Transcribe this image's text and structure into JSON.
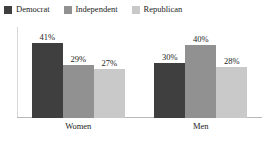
{
  "chart_data": {
    "type": "bar",
    "title": "",
    "subtitle": "",
    "xlabel": "",
    "ylabel": "",
    "categories": [
      "Women",
      "Men"
    ],
    "series": [
      {
        "name": "Democrat",
        "color": "#3f3f3f",
        "values": [
          41,
          30
        ],
        "labels": [
          "41%",
          "30%"
        ]
      },
      {
        "name": "Independent",
        "color": "#919191",
        "values": [
          29,
          40
        ],
        "labels": [
          "29%",
          "40%"
        ]
      },
      {
        "name": "Republican",
        "color": "#c9c9c9",
        "values": [
          27,
          28
        ],
        "labels": [
          "28%",
          "28%"
        ]
      }
    ],
    "value_suffix": "%",
    "ylim": [
      0,
      50
    ],
    "grid": false,
    "legend_position": "top-left",
    "axis_line_color": "#b9b9b9",
    "plot_border_color": "#d8d8d8"
  },
  "legend": {
    "items": [
      {
        "label": "Democrat",
        "color": "#3f3f3f"
      },
      {
        "label": "Independent",
        "color": "#919191"
      },
      {
        "label": "Republican",
        "color": "#c9c9c9"
      }
    ]
  },
  "groups": [
    {
      "category": "Women",
      "bars": [
        {
          "series": "Democrat",
          "label": "41%",
          "value": 41,
          "color": "#3f3f3f"
        },
        {
          "series": "Independent",
          "label": "29%",
          "value": 29,
          "color": "#919191"
        },
        {
          "series": "Republican",
          "label": "27%",
          "value": 27,
          "color": "#c9c9c9"
        }
      ]
    },
    {
      "category": "Men",
      "bars": [
        {
          "series": "Democrat",
          "label": "30%",
          "value": 30,
          "color": "#3f3f3f"
        },
        {
          "series": "Independent",
          "label": "40%",
          "value": 40,
          "color": "#919191"
        },
        {
          "series": "Republican",
          "label": "28%",
          "value": 28,
          "color": "#c9c9c9"
        }
      ]
    }
  ]
}
